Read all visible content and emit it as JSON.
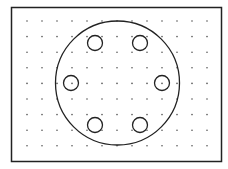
{
  "diagram": {
    "type": "bolt-circle-on-dot-grid",
    "colors": {
      "background": "#ffffff",
      "stroke": "#222222",
      "dot": "#555555"
    },
    "frame": {
      "x": 11.5,
      "y": 7.5,
      "width": 210,
      "height": 154
    },
    "dot_grid": {
      "x_start": 27,
      "x_step": 15,
      "columns": 13,
      "y_start": 21,
      "y_step": 15.6,
      "rows": 9,
      "dot_radius": 0.8
    },
    "outer_circle": {
      "cx": 117.5,
      "cy": 83,
      "r": 62
    },
    "holes": [
      {
        "cx": 95,
        "cy": 43,
        "r": 7.5
      },
      {
        "cx": 140,
        "cy": 43,
        "r": 7.5
      },
      {
        "cx": 71,
        "cy": 83,
        "r": 7.5
      },
      {
        "cx": 162,
        "cy": 83,
        "r": 7.5
      },
      {
        "cx": 95,
        "cy": 125,
        "r": 7.5
      },
      {
        "cx": 140,
        "cy": 125,
        "r": 7.5
      }
    ]
  }
}
